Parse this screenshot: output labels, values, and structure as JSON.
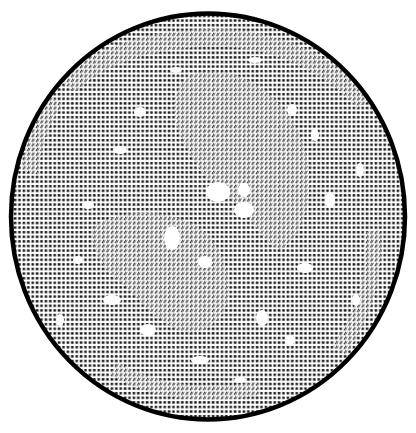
{
  "canvas": {
    "width": 416,
    "height": 433,
    "background": "#ffffff"
  },
  "figure": {
    "shape": "ellipse",
    "cx": 208,
    "cy": 216.5,
    "rx": 197,
    "ry": 203,
    "border_color": "#000000",
    "border_width": 4.5,
    "fill_pattern": "dot-grid",
    "ink_color": "#1a1a1a"
  },
  "patterns": {
    "dots": {
      "cell_w": 4.4,
      "cell_h": 4.6,
      "dot_w": 2.6,
      "dot_h": 2.4
    },
    "slashes": {
      "cell_w": 4.4,
      "cell_h": 4.6,
      "stroke_w": 0.9
    }
  },
  "slash_regions": [
    {
      "name": "upper-right-lobe",
      "d": "M 190 75 C 235 60, 290 95, 305 150 C 318 200, 300 240, 280 250 C 260 238, 250 215, 232 200 C 210 185, 190 160, 178 130 C 170 105, 175 85, 190 75 Z"
    },
    {
      "name": "lower-left-lobe",
      "d": "M 95 225 C 130 205, 175 212, 200 228 C 222 245, 232 275, 228 300 C 222 322, 205 335, 185 332 C 160 325, 140 300, 118 280 C 100 265, 88 245, 95 225 Z"
    },
    {
      "name": "outer-ring-top",
      "d": "M 60 80 C 100 40, 170 25, 240 30 C 300 38, 345 65, 370 100 L 358 108 C 330 78, 290 55, 240 48 C 175 42, 110 58, 75 92 Z"
    },
    {
      "name": "outer-ring-left",
      "d": "M 22 170 C 25 140, 35 115, 50 95 L 62 105 C 48 125, 40 150, 38 175 Z"
    },
    {
      "name": "outer-ring-right",
      "d": "M 380 230 C 385 270, 372 320, 345 355 L 332 345 C 358 312, 368 272, 364 232 Z"
    },
    {
      "name": "outer-ring-bottom",
      "d": "M 110 375 C 150 400, 210 405, 260 395 L 258 382 C 210 390, 155 386, 118 362 Z"
    }
  ],
  "white_blotches": [
    {
      "cx": 218,
      "cy": 192,
      "rx": 12,
      "ry": 10
    },
    {
      "cx": 244,
      "cy": 210,
      "rx": 10,
      "ry": 8
    },
    {
      "cx": 172,
      "cy": 238,
      "rx": 8,
      "ry": 12
    },
    {
      "cx": 205,
      "cy": 262,
      "rx": 7,
      "ry": 6
    },
    {
      "cx": 140,
      "cy": 112,
      "rx": 6,
      "ry": 5
    },
    {
      "cx": 292,
      "cy": 110,
      "rx": 5,
      "ry": 6
    },
    {
      "cx": 244,
      "cy": 190,
      "rx": 6,
      "ry": 7
    },
    {
      "cx": 305,
      "cy": 268,
      "rx": 8,
      "ry": 5
    },
    {
      "cx": 112,
      "cy": 300,
      "rx": 9,
      "ry": 5
    },
    {
      "cx": 148,
      "cy": 330,
      "rx": 8,
      "ry": 6
    },
    {
      "cx": 262,
      "cy": 318,
      "rx": 6,
      "ry": 8
    },
    {
      "cx": 330,
      "cy": 200,
      "rx": 5,
      "ry": 8
    },
    {
      "cx": 88,
      "cy": 205,
      "rx": 6,
      "ry": 4
    },
    {
      "cx": 78,
      "cy": 260,
      "rx": 5,
      "ry": 4
    },
    {
      "cx": 360,
      "cy": 170,
      "rx": 4,
      "ry": 7
    },
    {
      "cx": 356,
      "cy": 300,
      "rx": 4,
      "ry": 6
    },
    {
      "cx": 200,
      "cy": 360,
      "rx": 9,
      "ry": 4
    },
    {
      "cx": 120,
      "cy": 150,
      "rx": 7,
      "ry": 4
    },
    {
      "cx": 315,
      "cy": 135,
      "rx": 4,
      "ry": 6
    },
    {
      "cx": 176,
      "cy": 70,
      "rx": 6,
      "ry": 3
    },
    {
      "cx": 255,
      "cy": 60,
      "rx": 7,
      "ry": 3
    },
    {
      "cx": 60,
      "cy": 320,
      "rx": 4,
      "ry": 6
    },
    {
      "cx": 240,
      "cy": 380,
      "rx": 6,
      "ry": 3
    },
    {
      "cx": 290,
      "cy": 340,
      "rx": 5,
      "ry": 5
    }
  ]
}
